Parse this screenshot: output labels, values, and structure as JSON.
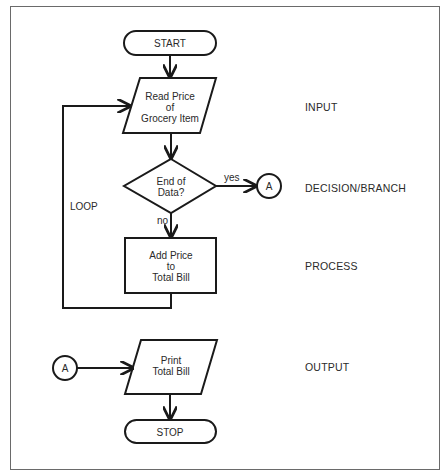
{
  "diagram": {
    "nodes": {
      "start": {
        "type": "terminator",
        "label": "START"
      },
      "input": {
        "type": "parallelogram",
        "label": "Read Price\nof\nGrocery Item"
      },
      "decision": {
        "type": "diamond",
        "label": "End of\nData?"
      },
      "connector_out": {
        "type": "connector",
        "label": "A"
      },
      "process": {
        "type": "rectangle",
        "label": "Add Price\nto\nTotal Bill"
      },
      "connector_in": {
        "type": "connector",
        "label": "A"
      },
      "output": {
        "type": "parallelogram",
        "label": "Print\nTotal Bill"
      },
      "stop": {
        "type": "terminator",
        "label": "STOP"
      }
    },
    "edges": {
      "yes_label": "yes",
      "no_label": "no",
      "loop_label": "LOOP"
    },
    "side_labels": {
      "input": "INPUT",
      "decision": "DECISION/BRANCH",
      "process": "PROCESS",
      "output": "OUTPUT"
    },
    "colors": {
      "stroke": "#1a1a1a",
      "frame": "#6a6a6a",
      "background": "#ffffff"
    }
  }
}
